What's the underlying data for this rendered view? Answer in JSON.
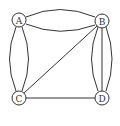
{
  "diagram": {
    "type": "multigraph",
    "colors": {
      "stroke": "#333333",
      "background": "#ffffff",
      "node_fill": "#ffffff"
    },
    "node_radius": 7,
    "nodes": [
      {
        "id": "A",
        "label": "A",
        "x": 19,
        "y": 20
      },
      {
        "id": "B",
        "label": "B",
        "x": 102,
        "y": 21
      },
      {
        "id": "C",
        "label": "C",
        "x": 19,
        "y": 98
      },
      {
        "id": "D",
        "label": "D",
        "x": 102,
        "y": 98
      }
    ],
    "edges": [
      {
        "from": "A",
        "to": "B",
        "shape": "curve-up"
      },
      {
        "from": "A",
        "to": "B",
        "shape": "curve-down"
      },
      {
        "from": "A",
        "to": "C",
        "shape": "curve-left"
      },
      {
        "from": "A",
        "to": "C",
        "shape": "curve-right"
      },
      {
        "from": "B",
        "to": "C",
        "shape": "straight"
      },
      {
        "from": "C",
        "to": "D",
        "shape": "straight"
      },
      {
        "from": "B",
        "to": "D",
        "shape": "curve-left"
      },
      {
        "from": "B",
        "to": "D",
        "shape": "straight"
      },
      {
        "from": "B",
        "to": "D",
        "shape": "curve-right"
      }
    ]
  }
}
